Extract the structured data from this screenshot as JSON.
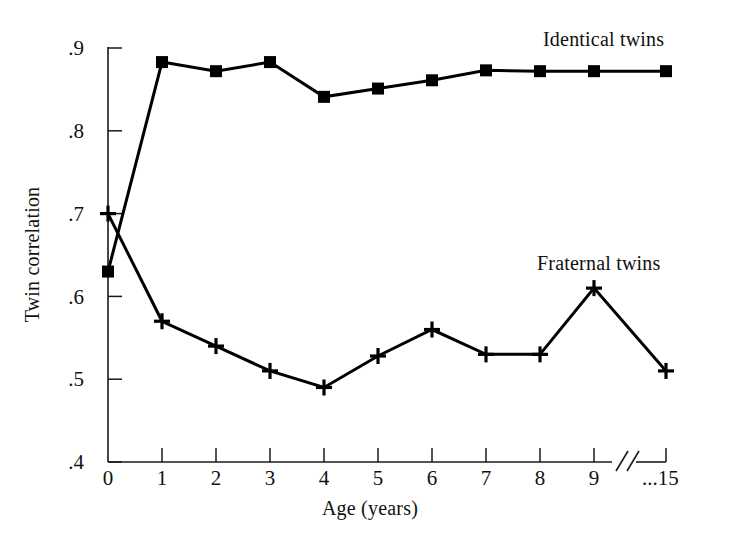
{
  "chart_data": {
    "type": "line",
    "title": "",
    "subtitle": "",
    "xlabel": "Age (years)",
    "ylabel": "Twin correlation",
    "grid": false,
    "legend_position": "inline-annotation",
    "axis_break": {
      "present": true,
      "between": [
        9,
        15
      ],
      "symbol": "//"
    },
    "x": [
      0,
      1,
      2,
      3,
      4,
      5,
      6,
      7,
      8,
      9,
      15
    ],
    "xtick_labels": [
      ".4",
      "0",
      "1",
      "2",
      "3",
      "4",
      "5",
      "6",
      "7",
      "8",
      "9",
      "...15"
    ],
    "xlim": [
      0,
      10
    ],
    "ylim": [
      0.4,
      0.9
    ],
    "ytick_labels": [
      ".9",
      ".8",
      ".7",
      ".6",
      ".5",
      ".4"
    ],
    "ytick_values": [
      0.9,
      0.8,
      0.7,
      0.6,
      0.5,
      0.4
    ],
    "series": [
      {
        "name": "Identical twins",
        "marker": "filled-square",
        "color": "#000000",
        "values": [
          0.63,
          0.883,
          0.872,
          0.883,
          0.841,
          0.851,
          0.861,
          0.873,
          0.872,
          0.872,
          0.872
        ]
      },
      {
        "name": "Fraternal twins",
        "marker": "plus",
        "color": "#000000",
        "values": [
          0.7,
          0.57,
          0.54,
          0.51,
          0.49,
          0.528,
          0.56,
          0.53,
          0.53,
          0.61,
          0.51
        ]
      }
    ],
    "annotations": [
      {
        "text": "Identical twins",
        "x": 7.05,
        "y": 0.945
      },
      {
        "text": "Fraternal twins",
        "x": 7.05,
        "y": 0.675
      }
    ]
  },
  "axis": {
    "y_title": "Twin correlation",
    "x_title": "Age (years)",
    "y_ticks": [
      ".9",
      ".8",
      ".7",
      ".6",
      ".5",
      ".4"
    ],
    "x_ticks": [
      "0",
      "1",
      "2",
      "3",
      "4",
      "5",
      "6",
      "7",
      "8",
      "9",
      "...15"
    ]
  },
  "labels": {
    "identical": "Identical twins",
    "fraternal": "Fraternal twins"
  }
}
